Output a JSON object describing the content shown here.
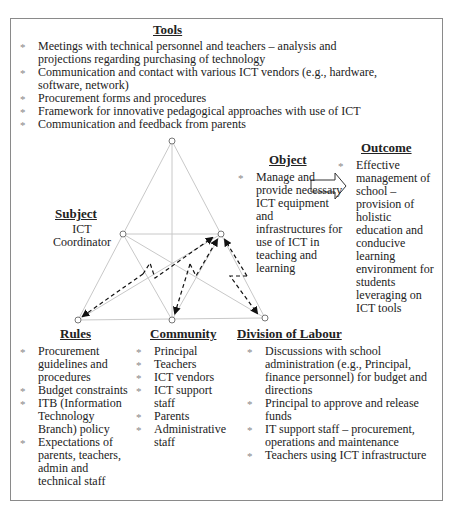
{
  "tools": {
    "heading": "Tools",
    "items": [
      "Meetings with technical personnel and teachers – analysis and projections regarding purchasing of technology",
      "Communication and contact with various ICT vendors (e.g., hardware, software, network)",
      "Procurement forms and procedures",
      "Framework for innovative pedagogical approaches with use of ICT",
      "Communication and feedback from parents"
    ]
  },
  "subject": {
    "heading": "Subject",
    "line1": "ICT",
    "line2": "Coordinator"
  },
  "object": {
    "heading": "Object",
    "items": [
      "Manage and provide necessary ICT equipment and infrastructures for use of ICT in teaching and learning"
    ]
  },
  "outcome": {
    "heading": "Outcome",
    "items": [
      "Effective management of school – provision of holistic education and conducive learning environment for students leveraging on ICT tools"
    ]
  },
  "rules": {
    "heading": "Rules",
    "items": [
      "Procurement guidelines and procedures",
      "Budget constraints",
      "ITB (Information Technology Branch) policy",
      "Expectations of parents, teachers, admin and technical staff"
    ]
  },
  "community": {
    "heading": "Community",
    "items": [
      "Principal",
      "Teachers",
      "ICT vendors",
      "ICT support staff",
      "Parents",
      "Administrative staff"
    ]
  },
  "division": {
    "heading": "Division of Labour",
    "items": [
      "Discussions with school administration (e.g., Principal, finance personnel) for budget and directions",
      "Principal to approve and release funds",
      "IT support staff – procurement, operations and maintenance",
      "Teachers using ICT infrastructure"
    ]
  },
  "diagram": {
    "nodes": {
      "tools": [
        172,
        141
      ],
      "subject": [
        123,
        234
      ],
      "object": [
        221,
        234
      ],
      "rules": [
        78,
        320
      ],
      "community": [
        172,
        320
      ],
      "division": [
        265,
        318
      ]
    },
    "colors": {
      "frame": "#8a8a8a",
      "triangle_lines": "#c8c8c8",
      "arrows": "#111111"
    }
  }
}
